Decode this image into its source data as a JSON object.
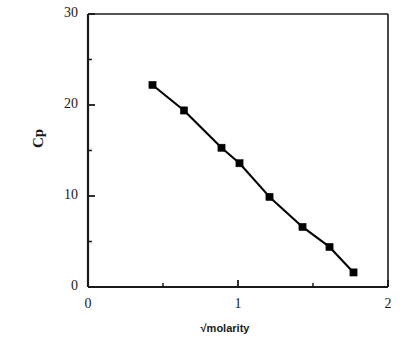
{
  "chart_data": {
    "type": "line",
    "title": "",
    "subtitle": "",
    "xlabel": "√molarity",
    "ylabel": "Cp",
    "xlim": [
      0,
      2
    ],
    "ylim": [
      0,
      30
    ],
    "xticks": [
      0,
      1,
      2
    ],
    "xtick_labels": [
      "0",
      "1",
      "2"
    ],
    "xminor_ticks": [
      0.5,
      1.5
    ],
    "yticks": [
      0,
      10,
      20,
      30
    ],
    "ytick_labels": [
      "0",
      "10",
      "20",
      "30"
    ],
    "yminor_ticks": [
      5,
      15,
      25
    ],
    "grid": false,
    "legend": null,
    "legend_position": "none",
    "marker": "filled-square",
    "line_color": "#000000",
    "marker_color": "#000000",
    "series": [
      {
        "name": "Cp vs √molarity",
        "x": [
          0.43,
          0.64,
          0.89,
          1.01,
          1.21,
          1.43,
          1.61,
          1.77
        ],
        "y": [
          22.2,
          19.4,
          15.3,
          13.6,
          9.9,
          6.6,
          4.4,
          1.6
        ]
      }
    ],
    "annotations": []
  },
  "axes": {
    "ylabel_text": "Cp",
    "xlabel_text": "√molarity"
  },
  "ticks": {
    "y": [
      {
        "value": 30,
        "label": "30"
      },
      {
        "value": 20,
        "label": "20"
      },
      {
        "value": 10,
        "label": "10"
      },
      {
        "value": 0,
        "label": "0"
      }
    ],
    "x": [
      {
        "value": 0,
        "label": "0"
      },
      {
        "value": 1,
        "label": "1"
      },
      {
        "value": 2,
        "label": "2"
      }
    ]
  },
  "colors": {
    "axis": "#1a1a1a",
    "data": "#000000",
    "background": "#ffffff"
  }
}
